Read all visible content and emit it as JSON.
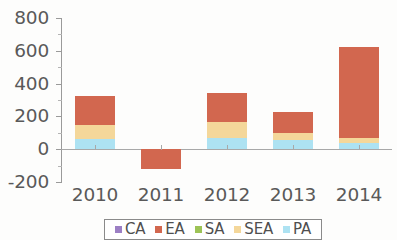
{
  "chart_data": {
    "type": "bar",
    "subtype": "stacked-bar",
    "title": "",
    "subtitle": "",
    "xlabel": "",
    "ylabel": "",
    "categories": [
      "2010",
      "2011",
      "2012",
      "2013",
      "2014"
    ],
    "ylim": [
      -200,
      800
    ],
    "yticks": [
      800,
      600,
      400,
      200,
      0,
      -200
    ],
    "ytick_labels": [
      "800",
      "600",
      "400",
      "200",
      "0",
      "-200"
    ],
    "grid": false,
    "legend_position": "bottom",
    "zero_line": 0,
    "series": [
      {
        "name": "CA",
        "color": "#9c7fc4",
        "values": [
          0,
          0,
          0,
          0,
          0
        ]
      },
      {
        "name": "EA",
        "color": "#d2674f",
        "values": [
          180,
          -120,
          175,
          125,
          555
        ]
      },
      {
        "name": "SA",
        "color": "#9dc356",
        "values": [
          0,
          0,
          0,
          0,
          0
        ]
      },
      {
        "name": "SEA",
        "color": "#f4d79a",
        "values": [
          80,
          0,
          95,
          45,
          35
        ]
      },
      {
        "name": "PA",
        "color": "#ade2f2",
        "values": [
          65,
          0,
          70,
          55,
          35
        ]
      }
    ],
    "totals": [
      325,
      -120,
      340,
      225,
      625
    ],
    "stack_order": [
      "PA",
      "SEA",
      "SA",
      "EA",
      "CA"
    ]
  },
  "axis": {
    "y_labels": [
      "800",
      "600",
      "400",
      "200",
      "0",
      "-200"
    ],
    "x_labels": [
      "2010",
      "2011",
      "2012",
      "2013",
      "2014"
    ]
  },
  "legend": {
    "entries": [
      {
        "label": "CA",
        "color": "#9c7fc4"
      },
      {
        "label": "EA",
        "color": "#d2674f"
      },
      {
        "label": "SA",
        "color": "#9dc356"
      },
      {
        "label": "SEA",
        "color": "#f4d79a"
      },
      {
        "label": "PA",
        "color": "#ade2f2"
      }
    ]
  }
}
